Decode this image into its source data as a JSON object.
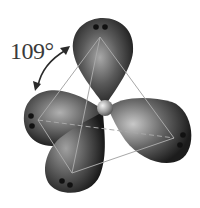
{
  "diagram": {
    "angle_label": "109°",
    "lobes": [
      {
        "name": "top",
        "electron_pairs": 2
      },
      {
        "name": "left",
        "electron_pairs": 2
      },
      {
        "name": "bottom",
        "electron_pairs": 2
      },
      {
        "name": "right",
        "electron_pairs": 2
      }
    ],
    "colors": {
      "lobe_dark": "#1e1e1e",
      "lobe_light": "#b8b8b8",
      "edge": "#9a9a9a",
      "text": "#3a3a3a"
    }
  }
}
